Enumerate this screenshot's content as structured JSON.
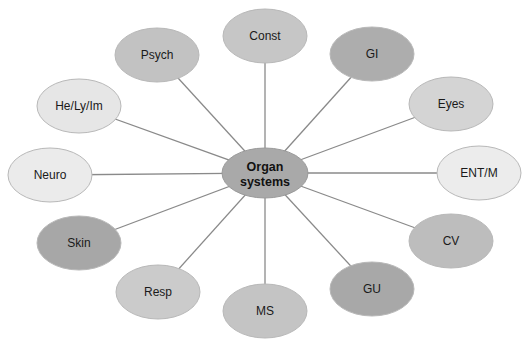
{
  "diagram": {
    "type": "hub-and-spoke",
    "center": {
      "id": "organ-systems",
      "lines": [
        "Organ",
        "systems"
      ],
      "x": 265,
      "y": 173,
      "rx": 43,
      "ry": 25,
      "fill": "#a9a9a9"
    },
    "edge_color": "#8a8a8a",
    "node_stroke": "#b8b8b8",
    "nodes": [
      {
        "id": "const",
        "label": "Const",
        "x": 265,
        "y": 36,
        "fill": "#c6c6c6"
      },
      {
        "id": "gi",
        "label": "GI",
        "x": 372,
        "y": 54,
        "fill": "#adadad"
      },
      {
        "id": "eyes",
        "label": "Eyes",
        "x": 451,
        "y": 104,
        "fill": "#d4d4d4"
      },
      {
        "id": "ent-m",
        "label": "ENT/M",
        "x": 479,
        "y": 173,
        "fill": "#ececec"
      },
      {
        "id": "cv",
        "label": "CV",
        "x": 451,
        "y": 241,
        "fill": "#bdbdbd"
      },
      {
        "id": "gu",
        "label": "GU",
        "x": 372,
        "y": 289,
        "fill": "#a8a8a8"
      },
      {
        "id": "ms",
        "label": "MS",
        "x": 265,
        "y": 311,
        "fill": "#c4c4c4"
      },
      {
        "id": "resp",
        "label": "Resp",
        "x": 158,
        "y": 292,
        "fill": "#cbcbcb"
      },
      {
        "id": "skin",
        "label": "Skin",
        "x": 79,
        "y": 243,
        "fill": "#a7a7a7"
      },
      {
        "id": "neuro",
        "label": "Neuro",
        "x": 50,
        "y": 175,
        "fill": "#ebebeb"
      },
      {
        "id": "he-ly-im",
        "label": "He/Ly/Im",
        "x": 79,
        "y": 106,
        "fill": "#e6e6e6"
      },
      {
        "id": "psych",
        "label": "Psych",
        "x": 157,
        "y": 55,
        "fill": "#c2c2c2"
      }
    ],
    "node_rx": 42,
    "node_ry": 27
  }
}
